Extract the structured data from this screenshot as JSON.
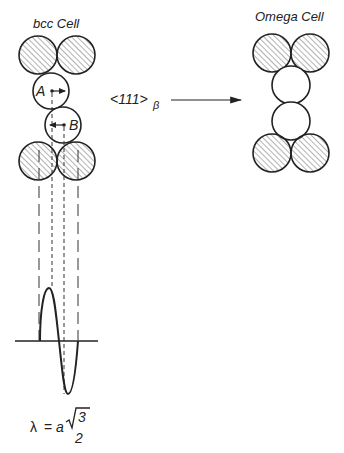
{
  "diagram": {
    "left_panel": {
      "title": "bcc Cell",
      "atom_a_label": "A",
      "atom_b_label": "B"
    },
    "transformation": {
      "direction_label": "<111>",
      "direction_subscript": "β"
    },
    "right_panel": {
      "title": "Omega Cell"
    },
    "formula": {
      "lhs": "λ",
      "equals": "=",
      "factor": "a",
      "numerator": "3",
      "denominator": "2"
    },
    "colors": {
      "stroke": "#222222",
      "hatch": "#555555",
      "background": "#ffffff"
    }
  }
}
